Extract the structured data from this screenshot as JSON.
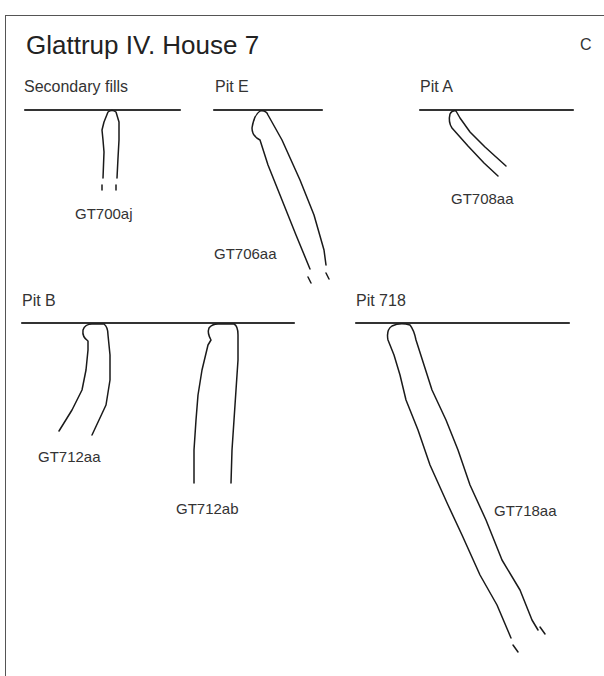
{
  "figure": {
    "title": "Glattrup IV. House 7",
    "panel_letter": "C"
  },
  "groups": [
    {
      "label": "Secondary fills",
      "samples": [
        "GT700aj"
      ]
    },
    {
      "label": "Pit E",
      "samples": [
        "GT706aa"
      ]
    },
    {
      "label": "Pit A",
      "samples": [
        "GT708aa"
      ]
    },
    {
      "label": "Pit B",
      "samples": [
        "GT712aa",
        "GT712ab"
      ]
    },
    {
      "label": "Pit 718",
      "samples": [
        "GT718aa"
      ]
    }
  ],
  "colors": {
    "line": "#1a1a1a",
    "surface": "#333333",
    "frame": "#555555"
  }
}
